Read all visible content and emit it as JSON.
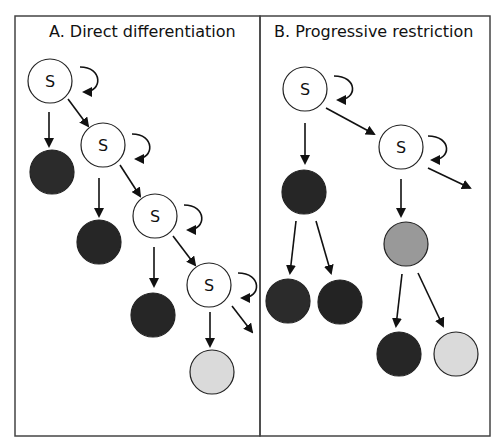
{
  "panels": [
    {
      "id": "A",
      "title": "A. Direct differentiation"
    },
    {
      "id": "B",
      "title": "B. Progressive restriction"
    }
  ],
  "stem_label": "S",
  "colors": {
    "stem_fill": "#ffffff",
    "dark_cell": "#2b2b2b",
    "medium_cell": "#999999",
    "light_cell": "#dadada",
    "stroke": "#222222"
  }
}
